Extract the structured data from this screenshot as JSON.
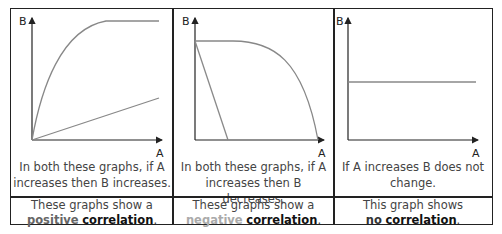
{
  "axes": {
    "x_label": "A",
    "y_label": "B"
  },
  "panels": [
    {
      "id": "positive",
      "curves": [
        "concave rise to plateau",
        "straight line rising"
      ],
      "description_line1": "In both these graphs, if A",
      "description_line2": "increases then B increases.",
      "conclusion_line1": "These graphs show a",
      "conclusion_keyword": "positive",
      "conclusion_term": "correlation",
      "conclusion_end": "."
    },
    {
      "id": "negative",
      "curves": [
        "plateau then falling curve",
        "steep straight line falling"
      ],
      "description_line1": "In both these graphs, if A",
      "description_line2": "increases then B decreases.",
      "conclusion_line1": "These graphs show a",
      "conclusion_keyword": "negative",
      "conclusion_term": "correlation",
      "conclusion_end": "."
    },
    {
      "id": "none",
      "curves": [
        "horizontal line"
      ],
      "description_line1": "If A increases B does not",
      "description_line2": "change.",
      "conclusion_line1": "This graph shows",
      "conclusion_keyword": "no",
      "conclusion_term": "correlation",
      "conclusion_end": "."
    }
  ],
  "colors": {
    "border": "#222222",
    "curve": "#888888",
    "axis": "#222222",
    "negative_keyword": "#aaaaaa"
  }
}
